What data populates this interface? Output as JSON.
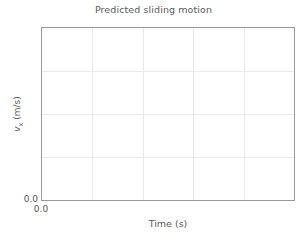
{
  "chart_data": {
    "type": "line",
    "title": "Predicted sliding motion",
    "xlabel": "Time (s)",
    "ylabel_plain": "v_x (m/s)",
    "ylabel_symbol": "v",
    "ylabel_subscript": "x",
    "ylabel_units": " (m/s)",
    "series": [
      {
        "name": "v_x",
        "x": [],
        "values": []
      }
    ],
    "x": [],
    "categories": [],
    "values": [],
    "xtick_labels": [
      "0.0"
    ],
    "ytick_labels": [
      "0.0"
    ],
    "xtick_positions": [
      0.0
    ],
    "ytick_positions": [
      0.0
    ],
    "xlim": [
      0.0,
      1.0
    ],
    "ylim": [
      0.0,
      1.0
    ],
    "grid": true,
    "grid_vertical_fractions": [
      0.2,
      0.4,
      0.6,
      0.8
    ],
    "grid_horizontal_fractions": [
      0.25,
      0.5,
      0.75
    ],
    "legend": null,
    "legend_position": "none",
    "annotations": [],
    "empty": true,
    "colors": {
      "background": "#ffffff",
      "plot_background": "#ffffff",
      "frame": "#9a9a9a",
      "grid": "#e9e9e9",
      "text": "#555555",
      "title_text": "#5a5a5a"
    }
  }
}
